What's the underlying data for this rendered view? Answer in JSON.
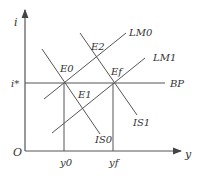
{
  "diagram": {
    "type": "IS-LM-BP",
    "axes": {
      "y_label": "i",
      "x_label": "y",
      "origin_label": "O"
    },
    "interest_rate_label": "i*",
    "output_labels": {
      "y0": "y0",
      "yf": "yf"
    },
    "curves": {
      "BP": "BP",
      "LM0": "LM0",
      "LM1": "LM1",
      "IS0": "IS0",
      "IS1": "IS1"
    },
    "equilibria": {
      "E0": "E0",
      "E1": "E1",
      "E2": "E2",
      "Ef": "Ef"
    },
    "colors": {
      "line": "#555555",
      "text": "#333333",
      "background": "#ffffff"
    }
  }
}
